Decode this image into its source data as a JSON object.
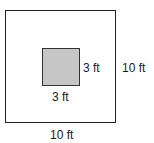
{
  "diagram": {
    "outer_square": {
      "width_label": "10 ft",
      "height_label": "10 ft"
    },
    "inner_square": {
      "width_label": "3 ft",
      "height_label": "3 ft",
      "fill": "#c6c6c6"
    }
  }
}
